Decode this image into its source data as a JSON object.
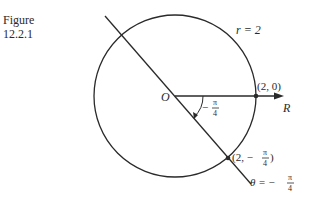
{
  "figure": {
    "caption_line1": "Figure",
    "caption_line2": "12.2.1"
  },
  "diagram": {
    "circle_label": "r = 2",
    "origin_label": "O",
    "axis_label": "R",
    "point_on_axis_label": "(2, 0)",
    "point_on_ray_label_prefix": "(2, −",
    "point_on_ray_label_suffix": ")",
    "angle_label_sign": "−",
    "ray_label_prefix": "θ = −",
    "fraction_num": "π",
    "fraction_den": "4",
    "colors": {
      "stroke": "#2a2a2a",
      "background": "#ffffff"
    }
  }
}
